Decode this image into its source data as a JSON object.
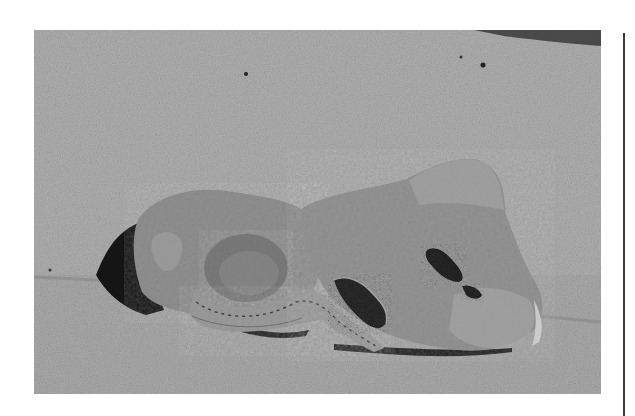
{
  "figure": {
    "colors": {
      "page_background": "#ffffff",
      "concrete_upper": "#a8a8a8",
      "concrete_lower": "#a4a4a4",
      "rock_body": "#8e8e8e",
      "rock_light": "#a0a0a0",
      "shadow": "#141414",
      "crystal_pocket": "#2a2a2a",
      "rule": "#3a3a3a"
    },
    "elements": [
      "concrete-background",
      "step-edge",
      "left-rock-specimen",
      "right-rock-specimen",
      "banded-rim",
      "crystal-pocket-left",
      "crystal-pocket-right",
      "cast-shadow"
    ]
  }
}
